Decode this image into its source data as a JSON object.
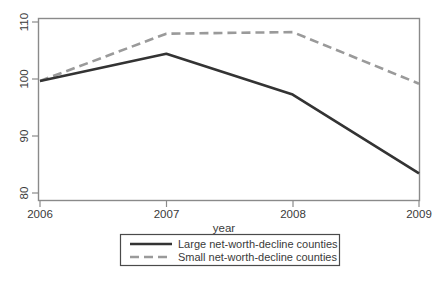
{
  "chart_data": {
    "type": "line",
    "title": "",
    "subtitle": "",
    "xlabel": "year",
    "ylabel": "",
    "x": [
      2006,
      2007,
      2008,
      2009
    ],
    "categories": [
      "2006",
      "2007",
      "2008",
      "2009"
    ],
    "series": [
      {
        "name": "Large net-worth-decline counties",
        "values": [
          100,
          105,
          97.5,
          83
        ],
        "style": "solid",
        "color": "#333333"
      },
      {
        "name": "Small net-worth-decline counties",
        "values": [
          100,
          108.7,
          109,
          99.5
        ],
        "style": "dashed",
        "color": "#9a9a9a"
      }
    ],
    "xlim": [
      2006,
      2009
    ],
    "ylim": [
      78,
      111.5
    ],
    "xticks": [
      "2006",
      "2007",
      "2008",
      "2009"
    ],
    "yticks": [
      "80",
      "90",
      "100",
      "110"
    ],
    "grid": false,
    "legend_position": "bottom"
  },
  "axes": {
    "x_title": "year",
    "x_tick_labels": [
      "2006",
      "2007",
      "2008",
      "2009"
    ],
    "y_tick_labels": [
      "110",
      "100",
      "90",
      "80"
    ]
  },
  "legend": {
    "entries": [
      {
        "label": "Large net-worth-decline counties",
        "style": "solid",
        "color": "#333333"
      },
      {
        "label": "Small net-worth-decline counties",
        "style": "dashed",
        "color": "#9a9a9a"
      }
    ]
  },
  "colors": {
    "large_series": "#333333",
    "small_series": "#9a9a9a",
    "frame": "#8a8a8a",
    "background": "#ffffff",
    "text": "#3a3a3a"
  }
}
